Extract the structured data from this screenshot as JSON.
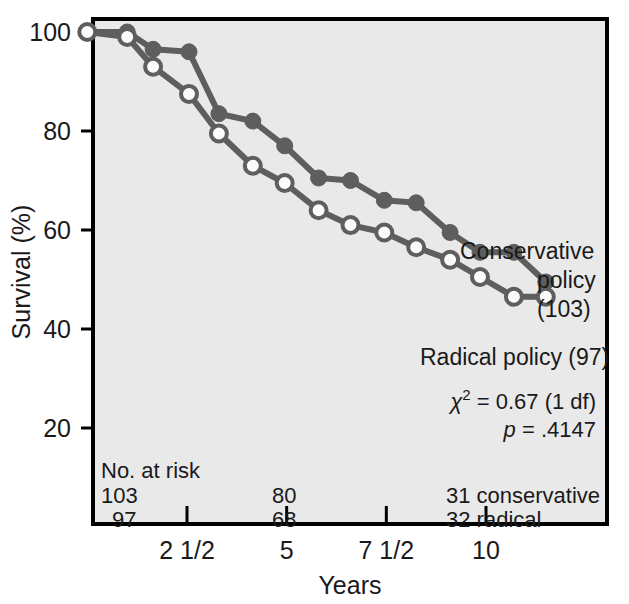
{
  "chart_data": {
    "type": "line",
    "title": "",
    "xlabel": "Years",
    "ylabel": "Survival (%)",
    "xlim": [
      0,
      12.9
    ],
    "ylim": [
      12,
      104
    ],
    "grid": false,
    "legend_position": "inline-right",
    "x_ticks": [
      {
        "value": 2.5,
        "label": "2 1/2"
      },
      {
        "value": 5,
        "label": "5"
      },
      {
        "value": 7.5,
        "label": "7 1/2"
      },
      {
        "value": 10,
        "label": "10"
      }
    ],
    "y_ticks": [
      {
        "value": 100,
        "label": "100"
      },
      {
        "value": 80,
        "label": "80"
      },
      {
        "value": 60,
        "label": "60"
      },
      {
        "value": 40,
        "label": "40"
      },
      {
        "value": 20,
        "label": "20"
      }
    ],
    "series": [
      {
        "name": "Conservative policy",
        "n": 103,
        "marker": "filled-circle",
        "color": "#5e5e5e",
        "points": [
          {
            "x": 0.0,
            "y": 100
          },
          {
            "x": 1.0,
            "y": 100
          },
          {
            "x": 1.65,
            "y": 96.5
          },
          {
            "x": 2.55,
            "y": 96.0
          },
          {
            "x": 3.3,
            "y": 83.5
          },
          {
            "x": 4.15,
            "y": 82.0
          },
          {
            "x": 4.95,
            "y": 77.0
          },
          {
            "x": 5.8,
            "y": 70.5
          },
          {
            "x": 6.6,
            "y": 70.0
          },
          {
            "x": 7.45,
            "y": 66.0
          },
          {
            "x": 8.25,
            "y": 65.5
          },
          {
            "x": 9.1,
            "y": 59.5
          },
          {
            "x": 9.85,
            "y": 55.5
          },
          {
            "x": 10.7,
            "y": 55.5
          },
          {
            "x": 11.5,
            "y": 49.5
          }
        ]
      },
      {
        "name": "Radical policy",
        "n": 97,
        "marker": "open-circle",
        "color": "#5e5e5e",
        "points": [
          {
            "x": 0.0,
            "y": 100
          },
          {
            "x": 1.0,
            "y": 99.0
          },
          {
            "x": 1.65,
            "y": 93.0
          },
          {
            "x": 2.55,
            "y": 87.5
          },
          {
            "x": 3.3,
            "y": 79.5
          },
          {
            "x": 4.15,
            "y": 73.0
          },
          {
            "x": 4.95,
            "y": 69.5
          },
          {
            "x": 5.8,
            "y": 64.0
          },
          {
            "x": 6.6,
            "y": 61.0
          },
          {
            "x": 7.45,
            "y": 59.5
          },
          {
            "x": 8.25,
            "y": 56.5
          },
          {
            "x": 9.1,
            "y": 54.0
          },
          {
            "x": 9.85,
            "y": 50.5
          },
          {
            "x": 10.7,
            "y": 46.5
          },
          {
            "x": 11.5,
            "y": 46.5
          }
        ]
      }
    ],
    "annotations": [
      {
        "id": "conservative-label-line1",
        "text": "Conservative"
      },
      {
        "id": "conservative-label-line2",
        "text": "policy"
      },
      {
        "id": "conservative-label-line3",
        "text": "(103)"
      },
      {
        "id": "radical-label",
        "text": "Radical policy (97)"
      }
    ]
  },
  "statistics": {
    "chi_symbol": "χ",
    "chi_exponent": "2",
    "chi_value": " = 0.67 (1 df)",
    "p_symbol": "p",
    "p_value": " = .4147"
  },
  "at_risk": {
    "heading": "No. at risk",
    "rows": [
      {
        "start": "103",
        "mid": "80",
        "end": "31 conservative"
      },
      {
        "start": "97",
        "mid": "68",
        "end": "32 radical"
      }
    ]
  },
  "colors": {
    "plot_background": "#e9e9e9",
    "page_background": "#ffffff",
    "axis": "#000000",
    "line": "#5e5e5e",
    "text": "#1a1a1a"
  }
}
